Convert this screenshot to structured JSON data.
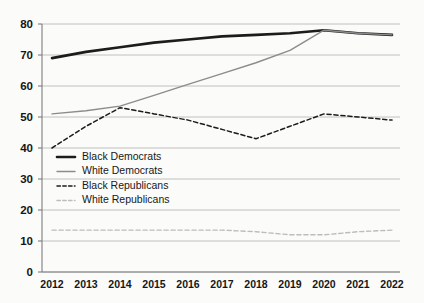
{
  "chart_data": {
    "type": "line",
    "title": "",
    "subtitle": "",
    "xlabel": "",
    "ylabel": "",
    "x": [
      2012,
      2013,
      2014,
      2015,
      2016,
      2017,
      2018,
      2019,
      2020,
      2021,
      2022
    ],
    "xtick_labels": [
      "2012",
      "2013",
      "2014",
      "2015",
      "2016",
      "2017",
      "2018",
      "2019",
      "2020",
      "2021",
      "2022"
    ],
    "ytick_labels": [
      "0",
      "10",
      "20",
      "30",
      "40",
      "50",
      "60",
      "70",
      "80"
    ],
    "yticks": [
      0,
      10,
      20,
      30,
      40,
      50,
      60,
      70,
      80
    ],
    "ylim": [
      0,
      80
    ],
    "grid": "horizontal",
    "legend_position": "inside-left",
    "series": [
      {
        "name": "Black Democrats",
        "style": "solid",
        "color": "#1c1c1c",
        "width": 2.6,
        "values": [
          69,
          71,
          72.5,
          74,
          75,
          76,
          76.5,
          77,
          78,
          77,
          76.5
        ]
      },
      {
        "name": "White Democrats",
        "style": "solid",
        "color": "#8c8c8c",
        "width": 1.4,
        "values": [
          51,
          52,
          53.5,
          57,
          60.5,
          64,
          67.5,
          71.5,
          78,
          77,
          76.5
        ]
      },
      {
        "name": "Black Republicans",
        "style": "dashed",
        "color": "#1c1c1c",
        "width": 1.5,
        "values": [
          40,
          47,
          53,
          51,
          49,
          46,
          43,
          47,
          51,
          50,
          49
        ]
      },
      {
        "name": "White Republicans",
        "style": "dashed",
        "color": "#bdbdbd",
        "width": 1.4,
        "values": [
          13.5,
          13.5,
          13.5,
          13.5,
          13.5,
          13.5,
          13,
          12,
          12,
          13,
          13.5
        ]
      }
    ]
  },
  "legend": {
    "items": [
      {
        "label": "Black Democrats"
      },
      {
        "label": "White Democrats"
      },
      {
        "label": "Black Republicans"
      },
      {
        "label": "White Republicans"
      }
    ]
  }
}
